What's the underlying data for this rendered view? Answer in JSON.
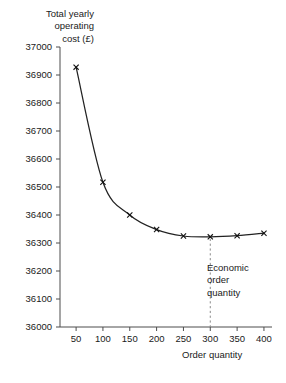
{
  "chart_data": {
    "type": "line",
    "title": "",
    "xlabel": "Order quantity",
    "ylabel": "Total yearly\noperating\ncost (£)",
    "x": [
      50,
      100,
      150,
      200,
      250,
      300,
      350,
      400
    ],
    "values": [
      36928,
      36517,
      36400,
      36348,
      36325,
      36322,
      36326,
      36335
    ],
    "series": [
      {
        "name": "Total yearly operating cost",
        "values": [
          36928,
          36517,
          36400,
          36348,
          36325,
          36322,
          36326,
          36335
        ]
      }
    ],
    "xlim": [
      20,
      415
    ],
    "ylim": [
      36000,
      37000
    ],
    "xticks": [
      50,
      100,
      150,
      200,
      250,
      300,
      350,
      400
    ],
    "xtick_labels": [
      "50",
      "100",
      "150",
      "200",
      "250",
      "300",
      "350",
      "400"
    ],
    "yticks": [
      36000,
      36100,
      36200,
      36300,
      36400,
      36500,
      36600,
      36700,
      36800,
      36900,
      37000
    ],
    "ytick_labels": [
      "36000",
      "36100",
      "36200",
      "36300",
      "36400",
      "36500",
      "36600",
      "36700",
      "36800",
      "36900",
      "37000"
    ],
    "grid": false,
    "legend": "none",
    "marker": "x",
    "line_color": "#222222",
    "annotations": [
      {
        "text": "Economic\norder\nquantity",
        "x": 300,
        "kind": "vertical-dashed-line-with-label"
      }
    ]
  },
  "axis_title_y": "Total yearly\noperating\ncost (£)",
  "axis_title_x": "Order quantity",
  "annotation_text": "Economic\norder\nquantity",
  "colors": {
    "background": "#ffffff",
    "axis": "#4d4d4d",
    "curve": "#222222",
    "dashed": "#8a8a8a",
    "text": "#1a1a1a"
  }
}
